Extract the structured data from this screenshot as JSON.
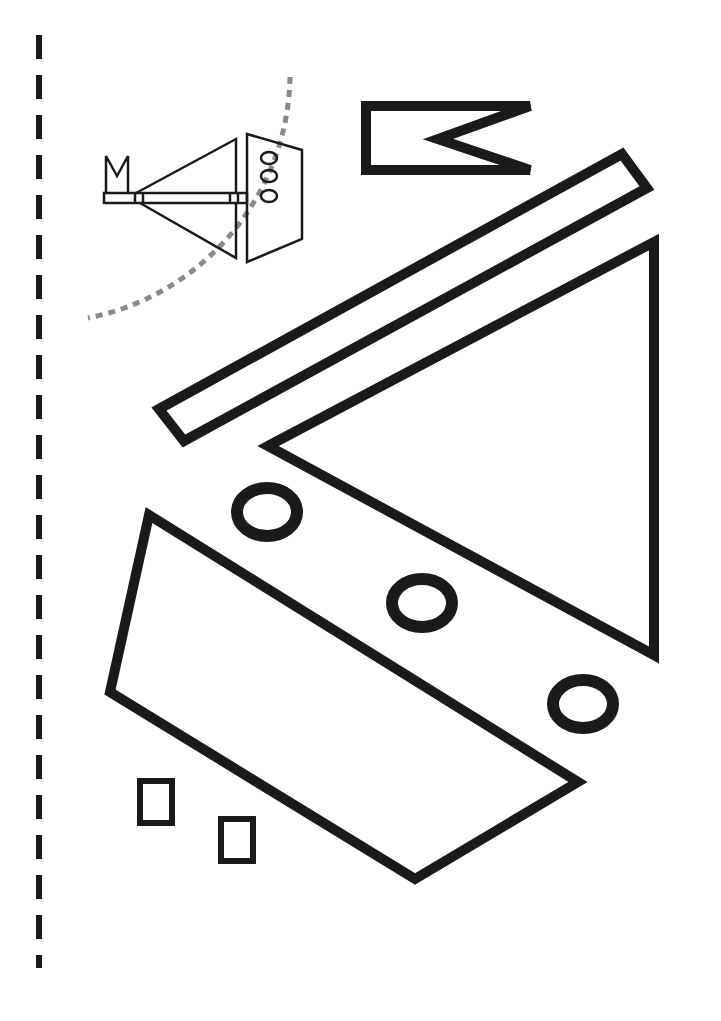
{
  "page": {
    "background": "#ffffff",
    "ink_color": "#1a1a1a",
    "guide_color": "#8a8a8a"
  },
  "cut_line": {
    "label": "fold/cut guide dashed line",
    "x": 39,
    "y_start": 35,
    "y_end": 968,
    "dash": 24,
    "gap": 16
  },
  "preview": {
    "label": "assembled boat preview",
    "arc_label": "dotted guide arc"
  },
  "pieces": [
    {
      "id": "flag",
      "label": "flag piece"
    },
    {
      "id": "mast",
      "label": "mast piece (long strip)"
    },
    {
      "id": "sail",
      "label": "sail piece (triangle)"
    },
    {
      "id": "hull",
      "label": "hull piece"
    },
    {
      "id": "porthole-1",
      "label": "porthole ring 1"
    },
    {
      "id": "porthole-2",
      "label": "porthole ring 2"
    },
    {
      "id": "porthole-3",
      "label": "porthole ring 3"
    },
    {
      "id": "block-1",
      "label": "small square 1"
    },
    {
      "id": "block-2",
      "label": "small square 2"
    }
  ]
}
